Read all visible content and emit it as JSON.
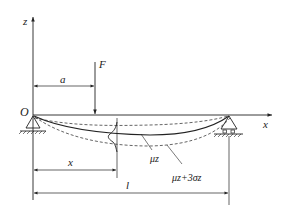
{
  "diagram": {
    "labels": {
      "z_axis": "z",
      "x_axis": "x",
      "origin": "O",
      "force": "F",
      "dim_a": "a",
      "dim_x": "x",
      "dim_l": "l",
      "mean_curve": "μz",
      "upper_curve": "μz+3σz"
    },
    "colors": {
      "line": "#222222",
      "background": "#ffffff"
    }
  }
}
